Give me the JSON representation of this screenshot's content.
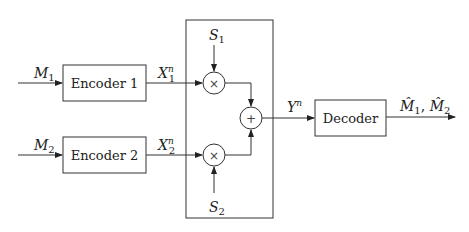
{
  "diagram": {
    "type": "block-diagram",
    "inputs": {
      "m1": {
        "main": "M",
        "sub": "1"
      },
      "m2": {
        "main": "M",
        "sub": "2"
      }
    },
    "encoders": [
      {
        "label": "Encoder 1"
      },
      {
        "label": "Encoder 2"
      }
    ],
    "encoder_outputs": [
      {
        "main": "X",
        "sub": "1",
        "sup": "n"
      },
      {
        "main": "X",
        "sub": "2",
        "sup": "n"
      }
    ],
    "states": [
      {
        "main": "S",
        "sub": "1"
      },
      {
        "main": "S",
        "sub": "2"
      }
    ],
    "operators": {
      "multiply_symbol": "×",
      "add_symbol": "+"
    },
    "channel_output": {
      "main": "Y",
      "sup": "n"
    },
    "decoder": {
      "label": "Decoder"
    },
    "decoder_output": {
      "m1_hat": {
        "main": "M̂",
        "sub": "1"
      },
      "separator": ", ",
      "m2_hat": {
        "main": "M̂",
        "sub": "2"
      }
    }
  }
}
